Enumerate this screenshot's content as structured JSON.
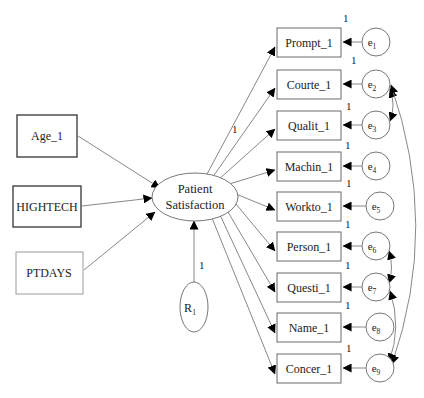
{
  "diagram": {
    "type": "structural-equation-model",
    "latent": {
      "label_line1": "Patient",
      "label_line2": "Satisfaction"
    },
    "predictors": [
      {
        "label": "Age_1"
      },
      {
        "label": "HIGHTECH"
      },
      {
        "label": "PTDAYS"
      }
    ],
    "residual": {
      "label": "R",
      "sub": "1",
      "weight": "1"
    },
    "indicators": [
      {
        "label": "Prompt_1",
        "error": "e",
        "error_sub": "1",
        "weight": "1"
      },
      {
        "label": "Courte_1",
        "error": "e",
        "error_sub": "2",
        "weight": "1"
      },
      {
        "label": "Qualit_1",
        "error": "e",
        "error_sub": "3",
        "weight": "1"
      },
      {
        "label": "Machin_1",
        "error": "e",
        "error_sub": "4",
        "weight": "1"
      },
      {
        "label": "Workto_1",
        "error": "e",
        "error_sub": "5",
        "weight": "1"
      },
      {
        "label": "Person_1",
        "error": "e",
        "error_sub": "6",
        "weight": "1"
      },
      {
        "label": "Questi_1",
        "error": "e",
        "error_sub": "7",
        "weight": "1"
      },
      {
        "label": "Name_1",
        "error": "e",
        "error_sub": "8",
        "weight": "1"
      },
      {
        "label": "Concer_1",
        "error": "e",
        "error_sub": "9",
        "weight": "1"
      }
    ],
    "loading_fixed_label": "1",
    "covariances": [
      [
        "e2",
        "e3"
      ],
      [
        "e2",
        "e9"
      ],
      [
        "e6",
        "e7"
      ],
      [
        "e7",
        "e9"
      ]
    ]
  }
}
